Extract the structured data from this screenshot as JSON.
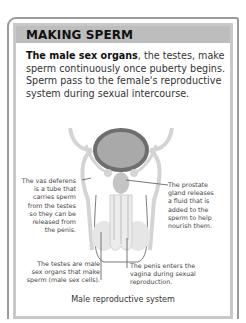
{
  "header": {
    "title": "MAKING SPERM"
  },
  "intro": {
    "bold": "The male sex organs",
    "rest": ", the testes, make sperm continuously once puberty begins. Sperm pass to the female's reproductive system during sexual intercourse."
  },
  "labels": {
    "vas_deferens": [
      "The vas deferens",
      "is a tube that",
      "carries sperm",
      "from the testes",
      "so they can be",
      "released from",
      "the penis."
    ],
    "prostate": [
      "The prostate",
      "gland releases",
      "a fluid that is",
      "added to the",
      "sperm to help",
      "nourish them."
    ],
    "testes": [
      "The testes are male",
      "sex organs that make",
      "sperm (male sex cells)."
    ],
    "penis": [
      "The penis enters the",
      "vagina during sexual",
      "reproduction."
    ]
  },
  "caption": "Male reproductive system",
  "colors": {
    "header": "#bdbdbd",
    "bladder": "#a9a9a9",
    "bladder_rim": "#6e6e6e",
    "tissue": "#d4d4d4",
    "outline": "#7a7a7a"
  }
}
